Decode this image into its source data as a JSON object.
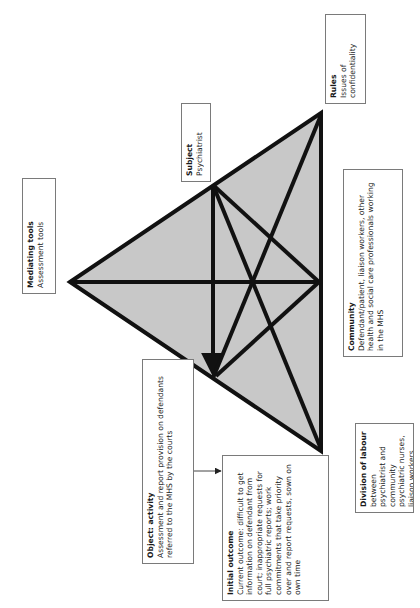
{
  "diagram": {
    "type": "activity-theory-triangle",
    "orientation": "rotated-90-ccw",
    "colors": {
      "triangle_fill": "#c8c8c8",
      "line": "#111111",
      "box_border": "#7a7a7a",
      "text": "#1a1a1a"
    },
    "nodes": {
      "mediating_tools": {
        "title": "Mediating tools",
        "body": "Assessment tools"
      },
      "subject": {
        "title": "Subject",
        "body": "Psychiatrist"
      },
      "rules": {
        "title": "Rules",
        "body": "Issues of confidentiality"
      },
      "community": {
        "title": "Community",
        "body": "Defendant/patient, liaison workers, other health and social care professionals working in the MHS"
      },
      "division_of_labour": {
        "title": "Division of labour",
        "body": "between psychiatrist and community psychiatric nurses, liaison workers"
      },
      "object": {
        "title": "Object: activity",
        "body": "Assessment and report provision on defendants referred to the MHS by the courts"
      },
      "initial_outcome": {
        "title": "Initial outcome",
        "body": "Current outcome: difficult to get information on defendant from court; inappropriate requests for full psychiatric reports; work commitments that take priority over and report requests, sown on own time"
      }
    }
  }
}
